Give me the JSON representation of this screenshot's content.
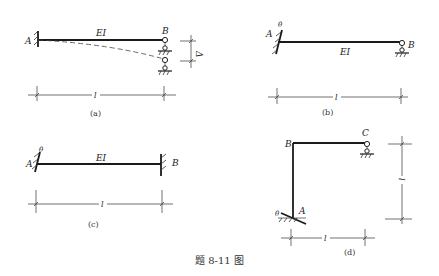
{
  "figure": {
    "title": "题 8-11 图",
    "panels": [
      {
        "id": "a",
        "caption": "(a)",
        "labels": {
          "left_support": "A",
          "right_support": "B",
          "stiffness": "EI",
          "span": "l",
          "settlement": "Δ"
        },
        "description": "Fixed at A, roller support at B which settles by Δ; dashed deflected shape"
      },
      {
        "id": "b",
        "caption": "(b)",
        "labels": {
          "left_support": "A",
          "right_support": "B",
          "stiffness": "EI",
          "span": "l",
          "rotation": "θ"
        },
        "description": "Fixed end A rotated by θ, roller support at B"
      },
      {
        "id": "c",
        "caption": "(c)",
        "labels": {
          "left_support": "A",
          "right_support": "B",
          "stiffness": "EI",
          "span": "l",
          "rotation": "θ"
        },
        "description": "Both ends fixed, end A rotated by θ"
      },
      {
        "id": "d",
        "caption": "(d)",
        "labels": {
          "base": "A",
          "corner": "B",
          "end": "C",
          "width": "l",
          "height": "l",
          "rotation": "θ"
        },
        "description": "L-frame: fixed base A rotated by θ, column A-B, beam B-C with roller at C"
      }
    ]
  }
}
